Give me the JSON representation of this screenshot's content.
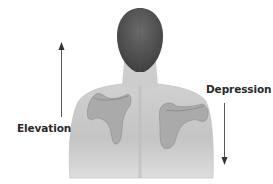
{
  "diagram": {
    "labels": {
      "elevation": "Elevation",
      "depression": "Depression"
    },
    "arrows": [
      {
        "name": "elevation-arrow",
        "direction": "up"
      },
      {
        "name": "depression-arrow",
        "direction": "down"
      }
    ],
    "colors": {
      "skin": "#c9c9c9",
      "skin_shadow": "#b0b0b0",
      "hair": "#4a4a4a",
      "scapula": "#a6a6a6",
      "arrow": "#444444",
      "text": "#2a2a2a"
    }
  }
}
